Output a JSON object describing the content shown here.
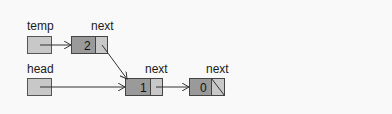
{
  "diagram": {
    "type": "linked-list",
    "colors": {
      "background": "#f9f9f9",
      "pointer_box": "#c8c8c8",
      "node_data": "#9a9a9a",
      "node_next": "#c8c8c8",
      "stroke": "#444444",
      "arrow": "#333333"
    },
    "pointers": [
      {
        "id": "temp",
        "label": "temp",
        "points_to": "node_2"
      },
      {
        "id": "head",
        "label": "head",
        "points_to": "node_1"
      }
    ],
    "nodes": [
      {
        "id": "node_2",
        "value": "2",
        "next_label": "next",
        "next": "node_1"
      },
      {
        "id": "node_1",
        "value": "1",
        "next_label": "next",
        "next": "node_0"
      },
      {
        "id": "node_0",
        "value": "0",
        "next_label": "next",
        "next": null
      }
    ]
  }
}
